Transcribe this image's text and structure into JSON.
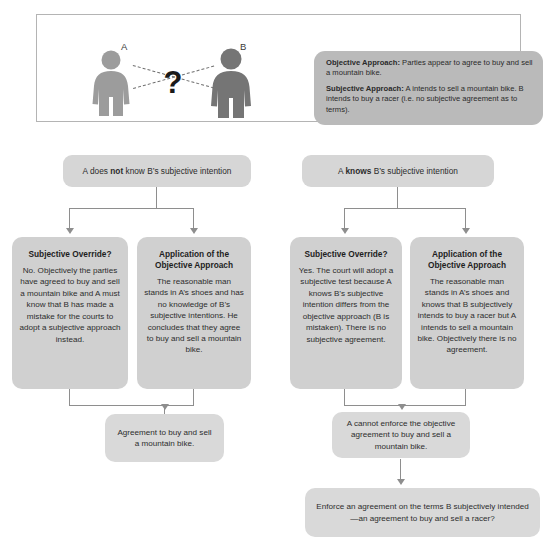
{
  "figure": {
    "label_a": "A",
    "label_b": "B",
    "question_mark": "?",
    "info": {
      "objective_label": "Objective Approach:",
      "objective_text": " Parties appear to agree to buy and sell a mountain bike.",
      "subjective_label": "Subjective Approach:",
      "subjective_text": " A intends to sell a mountain bike.  B intends to buy a racer (i.e. no subjective agreement as to terms)."
    }
  },
  "branches": {
    "left_header": {
      "pre": "A does ",
      "strong": "not",
      "post": " know B’s subjective intention"
    },
    "right_header": {
      "pre": "A ",
      "strong": "knows",
      "post": " B’s subjective intention"
    }
  },
  "nodes": [
    {
      "title": "Subjective Override?",
      "body": "No.  Objectively the parties have agreed to buy and sell a mountain bike and A must know that B has made a mistake for the courts to adopt a subjective approach instead."
    },
    {
      "title": "Application of the Objective Approach",
      "body": "The reasonable man stands in A’s shoes and has no knowledge of B’s subjective intentions. He concludes that they agree to buy and sell a mountain bike."
    },
    {
      "title": "Subjective Override?",
      "body": "Yes. The court will adopt a subjective test because A knows B’s subjective intention differs from the objective approach (B is mistaken). There is no subjective agreement."
    },
    {
      "title": "Application of the Objective Approach",
      "body": "The reasonable man stands in A’s shoes and knows that B subjectively intends to buy a racer but A intends to sell a mountain bike. Objectively there is no agreement."
    }
  ],
  "results": {
    "left": "Agreement to buy and sell a mountain bike.",
    "right": "A cannot enforce the objective agreement to buy and sell a mountain bike.",
    "final": "Enforce an agreement on the terms B subjectively intended—an agreement to buy and sell a racer?"
  },
  "colors": {
    "person_a": "#9c9c9c",
    "person_b": "#757575",
    "info_panel_bg": "#bababa",
    "pill_bg": "#d6d6d6",
    "node_bg": "#d0d0d0",
    "result_bg": "#d9d9d9",
    "connector": "#8e8e8e",
    "frame_border": "#b4b4b4"
  }
}
